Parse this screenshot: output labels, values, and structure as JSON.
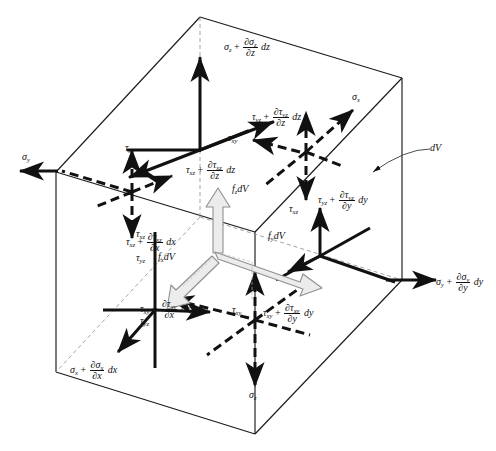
{
  "figure": {
    "title": "Differential stress element equilibrium diagram",
    "element_label": "dV",
    "symbols": {
      "sigma": "σ",
      "tau": "τ",
      "partial": "∂"
    },
    "colors": {
      "line": "#1a1a1a",
      "body_force_fill": "#e8e8e8",
      "body_force_stroke": "#8a8a8a",
      "background": "#ffffff"
    }
  },
  "labels": {
    "sigma_z_plus": {
      "base": "σ",
      "sub": "z",
      "num": "∂σ",
      "num_sub": "z",
      "den": "∂z",
      "diff": "dz"
    },
    "tau_yz_plus_dz": {
      "base": "τ",
      "sub": "yz",
      "num": "∂τ",
      "num_sub": "yz",
      "den": "∂z",
      "diff": "dz"
    },
    "tau_xz_plus_dz": {
      "base": "τ",
      "sub": "xz",
      "num": "∂τ",
      "num_sub": "xz",
      "den": "∂z",
      "diff": "dz"
    },
    "tau_xz_plus_dx": {
      "base": "τ",
      "sub": "xz",
      "num": "∂τ",
      "num_sub": "xz",
      "den": "∂x",
      "diff": "dx"
    },
    "tau_xy_plus_dx": {
      "base": "τ",
      "sub": "xy",
      "num": "∂τ",
      "num_sub": "xy",
      "den": "∂x",
      "diff": "dx"
    },
    "tau_xy_plus_dy": {
      "base": "τ",
      "sub": "xy",
      "num": "∂τ",
      "num_sub": "xy",
      "den": "∂y",
      "diff": "dy"
    },
    "tau_yz_plus_dy": {
      "base": "τ",
      "sub": "yz",
      "num": "∂τ",
      "num_sub": "yz",
      "den": "∂y",
      "diff": "dy"
    },
    "sigma_y_plus_dy": {
      "base": "σ",
      "sub": "y",
      "num": "∂σ",
      "num_sub": "y",
      "den": "∂y",
      "diff": "dy"
    },
    "sigma_x_plus_dx": {
      "base": "σ",
      "sub": "x",
      "num": "∂σ",
      "num_sub": "x",
      "den": "∂x",
      "diff": "dx"
    }
  },
  "plain_labels": {
    "sigma_x": {
      "base": "σ",
      "sub": "x"
    },
    "sigma_y": {
      "base": "σ",
      "sub": "y"
    },
    "sigma_z": {
      "base": "σ",
      "sub": "z"
    },
    "tau_xy_left": {
      "base": "τ",
      "sub": "xy"
    },
    "tau_xy_top": {
      "base": "τ",
      "sub": "xy"
    },
    "tau_xy_front": {
      "base": "τ",
      "sub": "xy"
    },
    "tau_xz_left": {
      "base": "τ",
      "sub": "xz"
    },
    "tau_xz_right": {
      "base": "τ",
      "sub": "xz"
    },
    "tau_yz_left": {
      "base": "τ",
      "sub": "yz"
    },
    "tau_yz_bottom": {
      "base": "τ",
      "sub": "yz"
    }
  },
  "body_forces": {
    "fz": {
      "base": "f",
      "sub": "z",
      "suffix": "dV"
    },
    "fy": {
      "base": "f",
      "sub": "y",
      "suffix": "dV"
    },
    "fx": {
      "base": "f",
      "sub": "x",
      "suffix": "dV"
    }
  },
  "annotation": {
    "dv": "dV"
  }
}
